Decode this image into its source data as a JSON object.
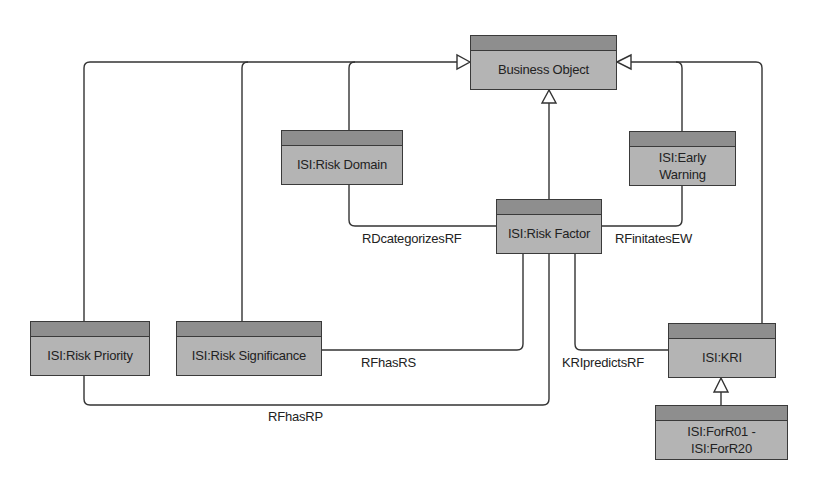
{
  "diagram": {
    "type": "UML class diagram",
    "colors": {
      "box_fill": "#b4b4b4",
      "box_header": "#8e8e8e",
      "border": "#3a3a3a",
      "line": "#333333",
      "background": "#ffffff"
    },
    "classes": {
      "business_object": {
        "label": "Business Object"
      },
      "risk_domain": {
        "label": "ISI:Risk Domain"
      },
      "early_warning": {
        "label": "ISI:Early Warning"
      },
      "risk_factor": {
        "label": "ISI:Risk Factor"
      },
      "risk_priority": {
        "label": "ISI:Risk Priority"
      },
      "risk_significance": {
        "label": "ISI:Risk Significance"
      },
      "kri": {
        "label": "ISI:KRI"
      },
      "forr": {
        "label": "ISI:ForR01 - ISI:ForR20"
      }
    },
    "associations": {
      "rd_categorizes_rf": {
        "label": "RDcategorizesRF",
        "from": "ISI:Risk Domain",
        "to": "ISI:Risk Factor"
      },
      "rf_initiates_ew": {
        "label": "RFinitatesEW",
        "from": "ISI:Risk Factor",
        "to": "ISI:Early Warning"
      },
      "rf_has_rs": {
        "label": "RFhasRS",
        "from": "ISI:Risk Factor",
        "to": "ISI:Risk Significance"
      },
      "rf_has_rp": {
        "label": "RFhasRP",
        "from": "ISI:Risk Factor",
        "to": "ISI:Risk Priority"
      },
      "kri_predicts_rf": {
        "label": "KRIpredictsRF",
        "from": "ISI:KRI",
        "to": "ISI:Risk Factor"
      }
    },
    "generalizations": [
      {
        "child": "ISI:Risk Priority",
        "parent": "Business Object"
      },
      {
        "child": "ISI:Risk Significance",
        "parent": "Business Object"
      },
      {
        "child": "ISI:Risk Domain",
        "parent": "Business Object"
      },
      {
        "child": "ISI:Risk Factor",
        "parent": "Business Object"
      },
      {
        "child": "ISI:Early Warning",
        "parent": "Business Object"
      },
      {
        "child": "ISI:KRI",
        "parent": "Business Object"
      },
      {
        "child": "ISI:ForR01 - ISI:ForR20",
        "parent": "ISI:KRI"
      }
    ]
  }
}
